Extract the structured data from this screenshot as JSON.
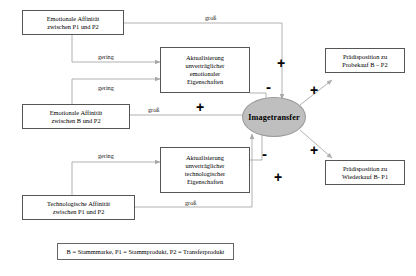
{
  "diagram": {
    "colors": {
      "node_border": "#555555",
      "ellipse_fill": "#bfbfbf",
      "wire": "#a8a8a8",
      "text": "#000000"
    },
    "nodes": {
      "emotional_affinity_p1_p2": {
        "line1": "Emotionale Affinität",
        "line2": "zwischen P1 und P2"
      },
      "emotional_affinity_b_p2": {
        "line1": "Emotionale Affinität",
        "line2": "zwischen B und P2"
      },
      "technological_affinity_p1_p2": {
        "line1": "Technologische Affinität",
        "line2": "zwischen P1 und P2"
      },
      "update_emotional": {
        "line1": "Aktualisierung",
        "line2": "unverträglicher",
        "line3": "emotionaler",
        "line4": "Eigenschaften"
      },
      "update_technological": {
        "line1": "Aktualisierung",
        "line2": "unverträglicher",
        "line3": "technologischer",
        "line4": "Eigenschaften"
      },
      "imagetransfer": {
        "label": "Imagetransfer"
      },
      "predisposition_trial": {
        "line1": "Prädisposition zu",
        "line2": "Probekauf B – P2"
      },
      "predisposition_repurchase": {
        "line1": "Prädisposition zu",
        "line2": "Wiederkauf B- P1"
      }
    },
    "edge_labels": {
      "top_gross": "groß",
      "upper_gering": "gering",
      "middle_gering": "gering",
      "middle_gross": "groß",
      "lower_gering": "gering",
      "bottom_gross": "groß"
    },
    "signs": {
      "emotional_box_minus": "-",
      "technological_box_minus": "-",
      "top_plus": "+",
      "middle_plus": "+",
      "bottom_plus": "+",
      "trial_plus": "+",
      "repurchase_plus": "+"
    },
    "legend": {
      "text": "B = Stammmarke, P1 = Stammprodukt, P2 = Transferprodukt"
    }
  }
}
